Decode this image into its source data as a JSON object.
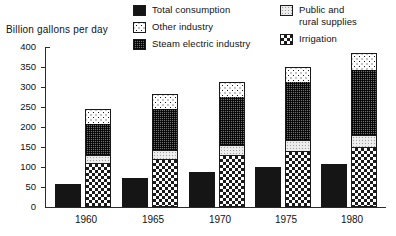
{
  "chart_data": {
    "type": "bar",
    "subtype": "grouped-and-stacked",
    "title": "",
    "xlabel": "",
    "ylabel": "Billion gallons per day",
    "ylim": [
      0,
      400
    ],
    "yticks": [
      0,
      50,
      100,
      150,
      200,
      250,
      300,
      350,
      400
    ],
    "grid": false,
    "legend_position": "top",
    "categories": [
      "1960",
      "1965",
      "1970",
      "1975",
      "1980"
    ],
    "series": [
      {
        "name": "Total consumption",
        "swatch": "solid-black",
        "bar_type": "standalone",
        "values": [
          57,
          72,
          87,
          100,
          107
        ]
      },
      {
        "name": "Irrigation",
        "swatch": "checkerboard",
        "bar_type": "stack-segment",
        "stack_order": 1,
        "values": [
          110,
          120,
          130,
          140,
          150
        ]
      },
      {
        "name": "Public and rural supplies",
        "swatch": "light-stipple",
        "bar_type": "stack-segment",
        "stack_order": 2,
        "values": [
          20,
          22,
          25,
          27,
          30
        ]
      },
      {
        "name": "Steam electric industry",
        "swatch": "dense-hatch",
        "bar_type": "stack-segment",
        "stack_order": 3,
        "values": [
          80,
          105,
          122,
          148,
          165
        ]
      },
      {
        "name": "Other industry",
        "swatch": "sparse-dots",
        "bar_type": "stack-segment",
        "stack_order": 4,
        "values": [
          35,
          35,
          35,
          35,
          40
        ]
      }
    ],
    "stack_totals": [
      245,
      282,
      312,
      350,
      385
    ]
  },
  "axis": {
    "y_title": "Billion gallons per day",
    "y_ticks": [
      "400",
      "350",
      "300",
      "250",
      "200",
      "150",
      "100",
      "50",
      "0"
    ],
    "x_ticks": [
      "1960",
      "1965",
      "1970",
      "1975",
      "1980"
    ]
  },
  "legend": {
    "column_a": [
      {
        "label": "Total consumption",
        "swatch": "solid-black"
      },
      {
        "label": "Other industry",
        "swatch": "sparse-dots"
      },
      {
        "label": "Steam electric industry",
        "swatch": "dense-hatch"
      }
    ],
    "column_b": [
      {
        "label": "Public and\nrural supplies",
        "swatch": "light-stipple"
      },
      {
        "label": "Irrigation",
        "swatch": "checkerboard"
      }
    ]
  },
  "colors": {
    "ink": "#151515",
    "axis": "#2b2b2b",
    "background": "#ffffff",
    "light_fill": "#ececec",
    "hatch_fill": "#6f6f6f"
  }
}
